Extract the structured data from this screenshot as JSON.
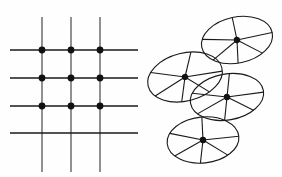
{
  "figure": {
    "background_color": "#ffffff",
    "ink_color": "#1a1a1a",
    "line_color": "#555555",
    "width": 282,
    "height": 177
  },
  "header": {
    "clipped_text": "夕 夕 丿 这 地 球 上 的 每 个 人 都 在 不 断 地 ...",
    "note": "partially cropped line of text at top edge"
  },
  "panels": [
    {
      "id": "grid-panel",
      "label": "square lattice grid",
      "kind": "grid",
      "vertical_lines_count": 3,
      "horizontal_lines_count": 4,
      "lattice_points_count": 9,
      "dot_color": "#111111",
      "dot_radius": 3.4,
      "line_width": 1.3
    },
    {
      "id": "ellipse-panel",
      "label": "cluster of spoked ellipses",
      "kind": "ellipses",
      "ellipse_count": 4,
      "spokes_per_ellipse": 6,
      "dot_color": "#111111",
      "dot_radius": 3.2,
      "line_width": 1.1
    }
  ],
  "chart_data": {
    "type": "scatter",
    "xlabel": "",
    "ylabel": "",
    "grid": true,
    "legend": "none",
    "xlim": [
      0,
      282
    ],
    "ylim": [
      0,
      177
    ],
    "grid_lines": {
      "vertical_x": [
        42,
        71,
        100
      ],
      "vertical_y_span": [
        17,
        172
      ],
      "horizontal_y": [
        50,
        78,
        106,
        133
      ],
      "horizontal_x_span": [
        10,
        138
      ]
    },
    "lattice_points": [
      {
        "x": 42,
        "y": 50
      },
      {
        "x": 71,
        "y": 50
      },
      {
        "x": 100,
        "y": 50
      },
      {
        "x": 42,
        "y": 78
      },
      {
        "x": 71,
        "y": 78
      },
      {
        "x": 100,
        "y": 78
      },
      {
        "x": 42,
        "y": 106
      },
      {
        "x": 71,
        "y": 106
      },
      {
        "x": 100,
        "y": 106
      }
    ],
    "ellipses": [
      {
        "name": "ellipse-top-right",
        "cx": 237,
        "cy": 40,
        "rx": 36,
        "ry": 23,
        "rotation": -12,
        "spoke_angles": [
          0,
          52,
          96,
          140,
          200,
          270
        ]
      },
      {
        "name": "ellipse-left-middle",
        "cx": 185,
        "cy": 77,
        "rx": 38,
        "ry": 24,
        "rotation": -14,
        "spoke_angles": [
          8,
          58,
          104,
          152,
          212,
          288
        ]
      },
      {
        "name": "ellipse-right-middle",
        "cx": 227,
        "cy": 97,
        "rx": 37,
        "ry": 23,
        "rotation": -10,
        "spoke_angles": [
          4,
          50,
          100,
          150,
          205,
          280
        ]
      },
      {
        "name": "ellipse-bottom",
        "cx": 203,
        "cy": 140,
        "rx": 36,
        "ry": 23,
        "rotation": -6,
        "spoke_angles": [
          0,
          50,
          98,
          146,
          206,
          272
        ]
      }
    ]
  }
}
